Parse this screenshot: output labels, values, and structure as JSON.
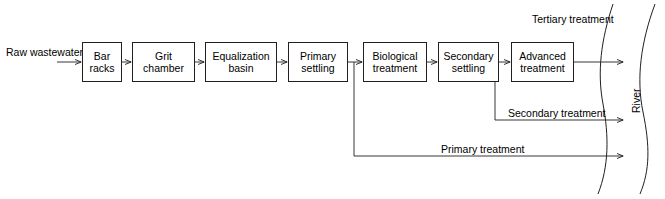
{
  "diagram": {
    "stroke_color": "#231f20",
    "background_color": "#ffffff",
    "source_label": {
      "line1": "Raw",
      "line2": "wastewater"
    },
    "process_boxes": [
      {
        "id": "bar-racks",
        "line1": "Bar",
        "line2": "racks"
      },
      {
        "id": "grit-chamber",
        "line1": "Grit",
        "line2": "chamber"
      },
      {
        "id": "equalization-basin",
        "line1": "Equalization",
        "line2": "basin"
      },
      {
        "id": "primary-settling",
        "line1": "Primary",
        "line2": "settling"
      },
      {
        "id": "biological-treatment",
        "line1": "Biological",
        "line2": "treatment"
      },
      {
        "id": "secondary-settling",
        "line1": "Secondary",
        "line2": "settling"
      },
      {
        "id": "advanced-treatment",
        "line1": "Advanced",
        "line2": "treatment"
      }
    ],
    "effluent_labels": {
      "tertiary": {
        "line1": "Tertiary",
        "line2": "treatment"
      },
      "secondary": "Secondary treatment",
      "primary": "Primary treatment"
    },
    "receiving_water": "River"
  }
}
